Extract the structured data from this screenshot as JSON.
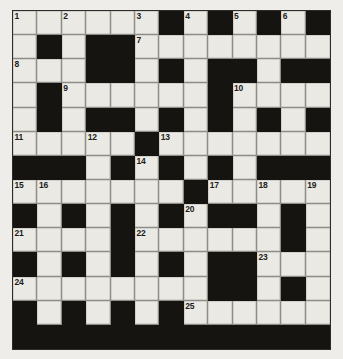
{
  "puzzle": {
    "title": "Crossword Grid",
    "type": "crossword",
    "columns": 13,
    "rows": 14,
    "colors": {
      "background": "#efeeea",
      "white_cell": "#eceae5",
      "black_cell": "#15130f",
      "grid_line": "#8e8e88",
      "border": "#2b2b29",
      "number_text": "#1b1b19"
    },
    "legend": {
      "W": "white (fillable) square",
      "B": "black (blocked) square"
    },
    "layout": [
      [
        "W",
        "W",
        "W",
        "W",
        "W",
        "W",
        "B",
        "W",
        "B",
        "W",
        "B",
        "W",
        "B"
      ],
      [
        "W",
        "B",
        "W",
        "B",
        "B",
        "W",
        "W",
        "W",
        "W",
        "W",
        "W",
        "W",
        "W"
      ],
      [
        "W",
        "W",
        "W",
        "B",
        "B",
        "W",
        "B",
        "W",
        "B",
        "B",
        "W",
        "B",
        "B"
      ],
      [
        "W",
        "B",
        "W",
        "W",
        "W",
        "W",
        "W",
        "W",
        "B",
        "W",
        "W",
        "W",
        "W"
      ],
      [
        "W",
        "B",
        "W",
        "B",
        "B",
        "W",
        "B",
        "W",
        "B",
        "W",
        "B",
        "W",
        "B"
      ],
      [
        "W",
        "W",
        "W",
        "W",
        "W",
        "B",
        "W",
        "W",
        "W",
        "W",
        "W",
        "W",
        "W"
      ],
      [
        "B",
        "B",
        "B",
        "W",
        "B",
        "W",
        "B",
        "W",
        "B",
        "W",
        "B",
        "B",
        "B"
      ],
      [
        "W",
        "W",
        "W",
        "W",
        "W",
        "W",
        "W",
        "B",
        "W",
        "W",
        "W",
        "W",
        "W"
      ],
      [
        "B",
        "W",
        "B",
        "W",
        "B",
        "W",
        "B",
        "W",
        "B",
        "B",
        "W",
        "B",
        "W"
      ],
      [
        "W",
        "W",
        "W",
        "W",
        "B",
        "W",
        "W",
        "W",
        "W",
        "W",
        "W",
        "B",
        "W"
      ],
      [
        "B",
        "W",
        "B",
        "W",
        "B",
        "W",
        "B",
        "W",
        "B",
        "B",
        "W",
        "W",
        "W"
      ],
      [
        "W",
        "W",
        "W",
        "W",
        "W",
        "W",
        "W",
        "W",
        "B",
        "B",
        "W",
        "B",
        "W"
      ],
      [
        "B",
        "W",
        "B",
        "W",
        "B",
        "W",
        "B",
        "W",
        "W",
        "W",
        "W",
        "W",
        "W"
      ],
      [
        "B",
        "B",
        "B",
        "B",
        "B",
        "B",
        "B",
        "B",
        "B",
        "B",
        "B",
        "B",
        "B"
      ]
    ],
    "numbers": [
      {
        "n": "1",
        "row": 0,
        "col": 0
      },
      {
        "n": "2",
        "row": 0,
        "col": 2
      },
      {
        "n": "3",
        "row": 0,
        "col": 5
      },
      {
        "n": "4",
        "row": 0,
        "col": 7
      },
      {
        "n": "5",
        "row": 0,
        "col": 9
      },
      {
        "n": "6",
        "row": 0,
        "col": 11
      },
      {
        "n": "7",
        "row": 1,
        "col": 5
      },
      {
        "n": "8",
        "row": 2,
        "col": 0
      },
      {
        "n": "9",
        "row": 3,
        "col": 2
      },
      {
        "n": "10",
        "row": 3,
        "col": 9
      },
      {
        "n": "11",
        "row": 5,
        "col": 0
      },
      {
        "n": "12",
        "row": 5,
        "col": 3
      },
      {
        "n": "13",
        "row": 5,
        "col": 6
      },
      {
        "n": "14",
        "row": 6,
        "col": 5
      },
      {
        "n": "15",
        "row": 7,
        "col": 0
      },
      {
        "n": "16",
        "row": 7,
        "col": 1
      },
      {
        "n": "17",
        "row": 7,
        "col": 8
      },
      {
        "n": "18",
        "row": 7,
        "col": 10
      },
      {
        "n": "19",
        "row": 7,
        "col": 12
      },
      {
        "n": "20",
        "row": 8,
        "col": 7
      },
      {
        "n": "21",
        "row": 9,
        "col": 0
      },
      {
        "n": "22",
        "row": 9,
        "col": 5
      },
      {
        "n": "23",
        "row": 10,
        "col": 10
      },
      {
        "n": "24",
        "row": 11,
        "col": 0
      },
      {
        "n": "25",
        "row": 12,
        "col": 7
      }
    ]
  }
}
